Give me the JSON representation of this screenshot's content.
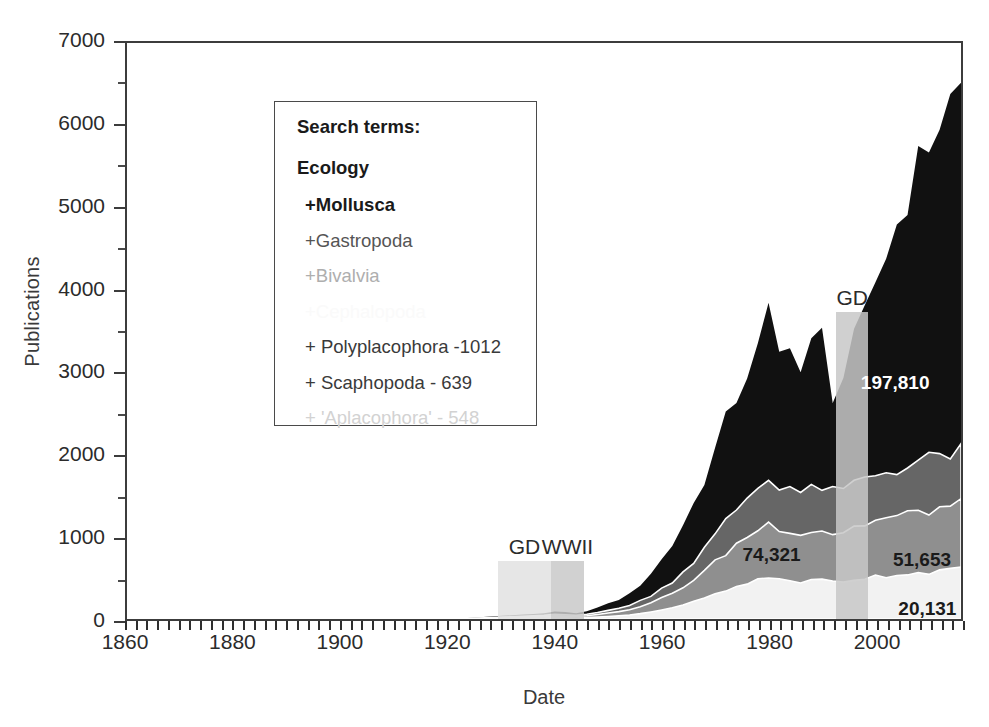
{
  "chart_data": {
    "type": "area",
    "title": "",
    "xlabel": "Date",
    "ylabel": "Publications",
    "xlim": [
      1860,
      2016
    ],
    "ylim": [
      0,
      7000
    ],
    "grid": false,
    "legend_position": "top-left-inset",
    "x_ticks": [
      1860,
      1880,
      1900,
      1920,
      1940,
      1960,
      1980,
      2000
    ],
    "y_ticks": [
      0,
      1000,
      2000,
      3000,
      4000,
      5000,
      6000,
      7000
    ],
    "y_minor_step": 500,
    "x_minor_step": 2,
    "stacked": true,
    "x": [
      1860,
      1865,
      1870,
      1875,
      1880,
      1885,
      1890,
      1895,
      1900,
      1905,
      1910,
      1915,
      1920,
      1923,
      1926,
      1928,
      1930,
      1932,
      1934,
      1936,
      1938,
      1940,
      1942,
      1944,
      1946,
      1948,
      1950,
      1952,
      1954,
      1956,
      1958,
      1960,
      1962,
      1964,
      1966,
      1968,
      1970,
      1972,
      1974,
      1976,
      1978,
      1980,
      1982,
      1984,
      1986,
      1988,
      1990,
      1992,
      1994,
      1996,
      1998,
      2000,
      2002,
      2004,
      2006,
      2008,
      2010,
      2012,
      2014,
      2016
    ],
    "series": [
      {
        "name": "Ecology",
        "color": "#111111",
        "label": "197,810",
        "values": [
          0,
          0,
          0,
          0,
          0,
          0,
          0,
          0,
          0,
          0,
          0,
          0,
          5,
          10,
          20,
          30,
          40,
          45,
          55,
          60,
          70,
          90,
          85,
          70,
          95,
          140,
          190,
          240,
          300,
          420,
          560,
          720,
          900,
          1150,
          1400,
          1700,
          2050,
          2400,
          2700,
          3000,
          3250,
          3700,
          3200,
          3450,
          3000,
          3300,
          3450,
          2750,
          2950,
          3350,
          3650,
          4100,
          4450,
          4800,
          5150,
          5500,
          5800,
          6050,
          6300,
          6450
        ]
      },
      {
        "name": "+Mollusca",
        "color": "#666666",
        "label": "74,321",
        "values": [
          0,
          0,
          0,
          0,
          0,
          0,
          0,
          0,
          0,
          0,
          0,
          0,
          3,
          6,
          12,
          18,
          24,
          28,
          34,
          38,
          44,
          56,
          52,
          44,
          58,
          80,
          105,
          130,
          165,
          220,
          290,
          370,
          460,
          580,
          700,
          850,
          1010,
          1180,
          1330,
          1480,
          1600,
          1700,
          1640,
          1610,
          1540,
          1560,
          1610,
          1530,
          1560,
          1640,
          1700,
          1760,
          1790,
          1830,
          1860,
          1900,
          1940,
          1980,
          2010,
          2040
        ]
      },
      {
        "name": "+Gastropoda",
        "color": "#8f8f8f",
        "label": "51,653",
        "values": [
          0,
          0,
          0,
          0,
          0,
          0,
          0,
          0,
          0,
          0,
          0,
          0,
          2,
          4,
          8,
          12,
          16,
          19,
          23,
          26,
          30,
          38,
          35,
          30,
          40,
          55,
          72,
          90,
          113,
          150,
          198,
          252,
          313,
          394,
          476,
          578,
          686,
          802,
          904,
          1006,
          1088,
          1156,
          1115,
          1094,
          1047,
          1061,
          1094,
          1040,
          1061,
          1115,
          1156,
          1197,
          1217,
          1244,
          1265,
          1292,
          1319,
          1346,
          1367,
          1387
        ]
      },
      {
        "name": "+Bivalvia",
        "color": "#f2f2f2",
        "label": "20,131",
        "values": [
          0,
          0,
          0,
          0,
          0,
          0,
          0,
          0,
          0,
          0,
          0,
          0,
          1,
          2,
          3,
          5,
          7,
          8,
          10,
          11,
          13,
          16,
          15,
          13,
          17,
          24,
          31,
          39,
          49,
          65,
          86,
          110,
          136,
          171,
          207,
          251,
          298,
          348,
          393,
          437,
          473,
          502,
          484,
          475,
          455,
          461,
          475,
          452,
          461,
          484,
          502,
          520,
          529,
          540,
          549,
          561,
          573,
          585,
          594,
          602
        ]
      },
      {
        "name": "+Cephalopoda",
        "color": "#fbfbfb",
        "label": "",
        "values": [
          0,
          0,
          0,
          0,
          0,
          0,
          0,
          0,
          0,
          0,
          0,
          0,
          0,
          0,
          0,
          0,
          0,
          0,
          0,
          0,
          0,
          0,
          0,
          0,
          0,
          0,
          0,
          0,
          0,
          0,
          0,
          0,
          0,
          0,
          0,
          0,
          0,
          0,
          0,
          0,
          0,
          0,
          0,
          0,
          0,
          0,
          0,
          0,
          0,
          0,
          0,
          0,
          0,
          0,
          0,
          0,
          0,
          0,
          0,
          0
        ]
      }
    ],
    "annotations": [
      {
        "name": "great-depression-1",
        "label": "GD",
        "x_start": 1929,
        "x_end": 1939,
        "y_top": 700,
        "color": "#e2e2e2"
      },
      {
        "name": "world-war-two",
        "label": "WWII",
        "x_start": 1939,
        "x_end": 1945,
        "y_top": 700,
        "color": "#c9c9c9"
      },
      {
        "name": "great-depression-2",
        "label": "GD",
        "x_start": 1992,
        "x_end": 1998,
        "y_top": 3700,
        "color": "#c8c8c8"
      }
    ],
    "callouts": [
      {
        "name": "callout-ecology",
        "text": "197,810",
        "x": 2003,
        "y": 2900,
        "style": "on-dark"
      },
      {
        "name": "callout-mollusca",
        "text": "74,321",
        "x": 1980,
        "y": 820,
        "style": "on-light"
      },
      {
        "name": "callout-gastropoda",
        "text": "51,653",
        "x": 2008,
        "y": 760,
        "style": "on-light"
      },
      {
        "name": "callout-bivalvia",
        "text": "20,131",
        "x": 2009,
        "y": 170,
        "style": "on-light"
      }
    ]
  },
  "legend": {
    "heading": "Search terms:",
    "rows": [
      {
        "name": "legend-root-ecology",
        "text": "Ecology",
        "color": "#1a1a1a",
        "weight": "bold",
        "indent": false
      },
      {
        "name": "legend-item-mollusca",
        "text": "+Mollusca",
        "color": "#1a1a1a",
        "weight": "bold",
        "indent": true
      },
      {
        "name": "legend-item-gastropoda",
        "text": "+Gastropoda",
        "color": "#555555",
        "weight": "normal",
        "indent": true
      },
      {
        "name": "legend-item-bivalvia",
        "text": "+Bivalvia",
        "color": "#aeaeae",
        "weight": "normal",
        "indent": true
      },
      {
        "name": "legend-item-cephalopoda",
        "text": "+Cephalopoda",
        "color": "#fafafa",
        "weight": "normal",
        "indent": true
      },
      {
        "name": "legend-item-polyplacophora",
        "text": "+ Polyplacophora -1012",
        "color": "#3a3a3a",
        "weight": "normal",
        "indent": true
      },
      {
        "name": "legend-item-scaphopoda",
        "text": "+ Scaphopoda - 639",
        "color": "#3a3a3a",
        "weight": "normal",
        "indent": true
      },
      {
        "name": "legend-item-aplacophora",
        "text": "+ 'Aplacophora' - 548",
        "color": "#d2d2d2",
        "weight": "normal",
        "indent": true
      }
    ]
  }
}
